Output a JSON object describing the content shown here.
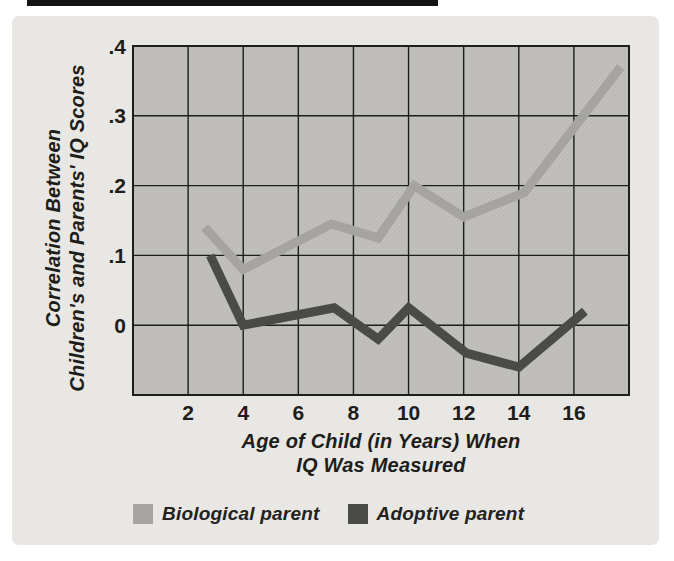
{
  "figure": {
    "y_axis_title_line1": "Correlation Between",
    "y_axis_title_line2": "Children's and Parents' IQ Scores",
    "x_axis_title_line1": "Age of Child (in Years) When",
    "x_axis_title_line2": "IQ Was Measured",
    "legend": [
      {
        "id": "biological",
        "label": "Biological parent",
        "color": "#a5a4a0"
      },
      {
        "id": "adoptive",
        "label": "Adoptive parent",
        "color": "#4a4a47"
      }
    ]
  },
  "colors": {
    "page_bg": "#ffffff",
    "card_bg": "#e8e7e3",
    "plot_bg": "#c1c0bc",
    "plot_dot": "#b6b5b1",
    "grid": "#1d1d1b",
    "text": "#1d1d1b",
    "biological_line": "#a5a4a0",
    "adoptive_line": "#4a4a47"
  },
  "chart_data": {
    "type": "line",
    "title": "",
    "xlabel": "Age of Child (in Years) When IQ Was Measured",
    "ylabel": "Correlation Between Children's and Parents' IQ Scores",
    "x_range": [
      0,
      18
    ],
    "y_range": [
      -0.1,
      0.4
    ],
    "x_ticks": [
      2,
      4,
      6,
      8,
      10,
      12,
      14,
      16
    ],
    "y_ticks": [
      {
        "value": 0.4,
        "label": ".4"
      },
      {
        "value": 0.3,
        "label": ".3"
      },
      {
        "value": 0.2,
        "label": ".2"
      },
      {
        "value": 0.1,
        "label": ".1"
      },
      {
        "value": 0.0,
        "label": "0"
      }
    ],
    "grid": true,
    "legend_position": "bottom",
    "series": [
      {
        "name": "Biological parent",
        "id": "biological-parent-line",
        "color": "#a5a4a0",
        "points": [
          [
            2.6,
            0.14
          ],
          [
            4,
            0.08
          ],
          [
            7.2,
            0.145
          ],
          [
            8.9,
            0.125
          ],
          [
            10.2,
            0.2
          ],
          [
            12,
            0.155
          ],
          [
            14.2,
            0.19
          ],
          [
            17.7,
            0.37
          ]
        ]
      },
      {
        "name": "Adoptive parent",
        "id": "adoptive-parent-line",
        "color": "#4a4a47",
        "points": [
          [
            2.8,
            0.1
          ],
          [
            4,
            0.0
          ],
          [
            7.3,
            0.025
          ],
          [
            8.9,
            -0.02
          ],
          [
            10,
            0.025
          ],
          [
            12.1,
            -0.04
          ],
          [
            14,
            -0.06
          ],
          [
            16.4,
            0.02
          ]
        ]
      }
    ]
  }
}
